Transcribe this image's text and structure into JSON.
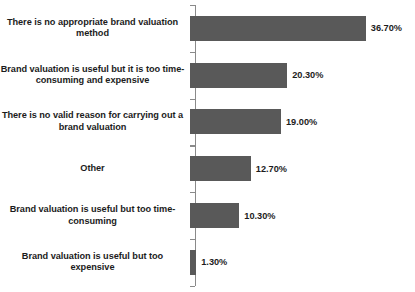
{
  "chart_data": {
    "type": "bar",
    "orientation": "horizontal",
    "title": "",
    "subtitle": "",
    "xlabel": "",
    "ylabel": "",
    "grid": false,
    "legend": null,
    "xlim": [
      0,
      40
    ],
    "axis_line": "category-axis-vertical",
    "value_format": "percent-two-decimals",
    "bar_color": "#595959",
    "background_color": "#FFFFFF",
    "text_color": "#1C1C1C",
    "categories": [
      "There is no appropriate brand valuation method",
      "Brand valuation is useful but it is too time-consuming and expensive",
      "There is no valid reason for carrying out a brand valuation",
      "Other",
      "Brand valuation is useful but too time-consuming",
      "Brand valuation is useful but too expensive"
    ],
    "values": [
      36.7,
      20.3,
      19.0,
      12.7,
      10.3,
      1.3
    ],
    "value_labels": [
      "36.70%",
      "20.30%",
      "19.00%",
      "12.70%",
      "10.30%",
      "1.30%"
    ]
  },
  "rows": [
    {
      "label_line1": "There is no appropriate brand valuation",
      "label_line2": "method",
      "value_label": "36.70%",
      "value": 36.7
    },
    {
      "label_line1": "Brand valuation is useful but it is too time-",
      "label_line2": "consuming and expensive",
      "value_label": "20.30%",
      "value": 20.3
    },
    {
      "label_line1": "There is no valid reason for carrying out a",
      "label_line2": "brand valuation",
      "value_label": "19.00%",
      "value": 19.0
    },
    {
      "label_line1": "Other",
      "label_line2": "",
      "value_label": "12.70%",
      "value": 12.7
    },
    {
      "label_line1": "Brand valuation is useful but too time-",
      "label_line2": "consuming",
      "value_label": "10.30%",
      "value": 10.3
    },
    {
      "label_line1": "Brand valuation is useful but too expensive",
      "label_line2": "",
      "value_label": "1.30%",
      "value": 1.3
    }
  ]
}
